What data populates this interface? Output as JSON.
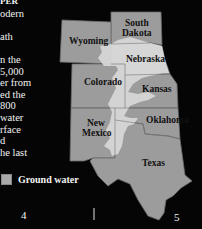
{
  "body_text": {
    "lines": [
      "PER",
      "odern",
      "",
      "ath",
      "",
      "n the",
      "5,000",
      "er from",
      "ed the",
      "800",
      " water",
      "rface",
      "d",
      "he last"
    ]
  },
  "map": {
    "states": [
      {
        "name": "South\nDakota",
        "line1": "South",
        "line2": "Dakota"
      },
      {
        "name": "Wyoming",
        "line1": "Wyoming"
      },
      {
        "name": "Nebraska",
        "line1": "Nebraska"
      },
      {
        "name": "Colorado",
        "line1": "Colorado"
      },
      {
        "name": "Kansas",
        "line1": "Kansas"
      },
      {
        "name": "New Mexico",
        "line1": "New",
        "line2": "Mexico"
      },
      {
        "name": "Oklahoma",
        "line1": "Oklahoma"
      },
      {
        "name": "Texas",
        "line1": "Texas"
      }
    ],
    "colors": {
      "state_fill": "#9c9c9c",
      "aquifer_fill": "#d6d6d6",
      "border": "#6a6a6a",
      "background": "#050505"
    }
  },
  "legend": {
    "label": "Ground water"
  },
  "page_numbers": {
    "left": "4",
    "right": "5"
  }
}
